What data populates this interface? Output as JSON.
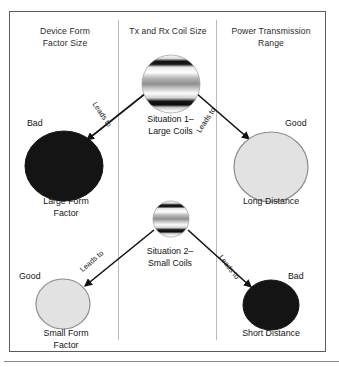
{
  "figure": {
    "columns": [
      {
        "id": "device-form-factor-size",
        "heading": "Device Form\nFactor Size"
      },
      {
        "id": "tx-rx-coil-size",
        "heading": "Tx and Rx Coil Size"
      },
      {
        "id": "power-transmission-range",
        "heading": "Power Transmission\nRange"
      }
    ],
    "column_headings": {
      "left": "Device Form Factor Size",
      "center": "Tx and Rx Coil Size",
      "right": "Power Transmission Range"
    },
    "column_heading_lines": {
      "left_line1": "Device Form",
      "left_line2": "Factor Size",
      "center_line1": "Tx and Rx Coil Size",
      "right_line1": "Power Transmission",
      "right_line2": "Range"
    },
    "nodes": {
      "situation1": {
        "caption_line1": "Situation 1–",
        "caption_line2": "Large Coils",
        "shape": "coil-circle",
        "radius": 29
      },
      "situation2": {
        "caption_line1": "Situation 2–",
        "caption_line2": "Small Coils",
        "shape": "coil-circle",
        "radius": 18
      },
      "large_form_factor": {
        "caption_line1": "Large Form",
        "caption_line2": "Factor",
        "evaluation": "Bad",
        "fill": "#141414",
        "stroke": "#141414",
        "radius_x": 39,
        "radius_y": 35
      },
      "long_distance": {
        "caption_line1": "Long Distance",
        "caption_line2": "",
        "evaluation": "Good",
        "fill": "#e2e2e2",
        "stroke": "#8d8d8d",
        "radius_x": 37,
        "radius_y": 35
      },
      "small_form_factor": {
        "caption_line1": "Small Form",
        "caption_line2": "Factor",
        "evaluation": "Good",
        "fill": "#e2e2e2",
        "stroke": "#8d8d8d",
        "radius_x": 27,
        "radius_y": 25
      },
      "short_distance": {
        "caption_line1": "Short Distance",
        "caption_line2": "",
        "evaluation": "Bad",
        "fill": "#141414",
        "stroke": "#141414",
        "radius_x": 28,
        "radius_y": 25
      }
    },
    "edges": [
      {
        "id": "sit1-to-large-form",
        "label": "Leads to",
        "from": "situation1",
        "to": "large_form_factor"
      },
      {
        "id": "sit1-to-long-dist",
        "label": "Leads to",
        "from": "situation1",
        "to": "long_distance"
      },
      {
        "id": "sit2-to-small-form",
        "label": "Leads to",
        "from": "situation2",
        "to": "small_form_factor"
      },
      {
        "id": "sit2-to-short-dist",
        "label": "Leads to",
        "from": "situation2",
        "to": "short_distance"
      }
    ],
    "colors": {
      "frame_border": "#5c5c5c",
      "divider": "#b9b9b9",
      "bad_fill": "#141414",
      "good_fill": "#e2e2e2",
      "good_stroke": "#8d8d8d",
      "arrow": "#111111",
      "text": "#141414",
      "background": "#ffffff"
    }
  }
}
